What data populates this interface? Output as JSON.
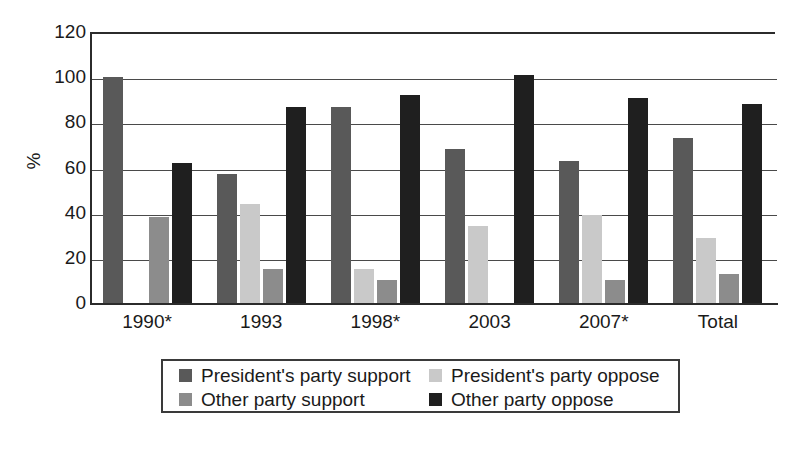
{
  "chart_data": {
    "type": "bar",
    "title": "",
    "subtitle": "",
    "xlabel": "",
    "ylabel": "%",
    "ylim": [
      0,
      120
    ],
    "ytick_step": 20,
    "yticks": [
      120,
      100,
      80,
      60,
      40,
      20,
      0
    ],
    "grid": true,
    "legend_position": "bottom-center",
    "categories": [
      "1990*",
      "1993",
      "1998*",
      "2003",
      "2007*",
      "Total"
    ],
    "series": [
      {
        "name": "President's party support",
        "color": "#595959",
        "values": [
          100,
          57,
          87,
          68,
          63,
          73
        ]
      },
      {
        "name": "President's party oppose",
        "color": "#c9c9c9",
        "values": [
          0,
          44,
          15,
          34,
          39,
          29
        ]
      },
      {
        "name": "Other party support",
        "color": "#8c8c8c",
        "values": [
          38,
          15,
          10,
          0,
          10,
          13
        ]
      },
      {
        "name": "Other party oppose",
        "color": "#1f1f1f",
        "values": [
          62,
          87,
          92,
          101,
          91,
          88
        ]
      }
    ]
  },
  "axis": {
    "y_title": "%",
    "y_tick_labels": [
      "120",
      "100",
      "80",
      "60",
      "40",
      "20",
      "0"
    ],
    "x_tick_labels": [
      "1990*",
      "1993",
      "1998*",
      "2003",
      "2007*",
      "Total"
    ]
  },
  "legend": {
    "entries": [
      {
        "label": "President's party support",
        "color": "#595959"
      },
      {
        "label": "President's party oppose",
        "color": "#c9c9c9"
      },
      {
        "label": "Other party support",
        "color": "#8c8c8c"
      },
      {
        "label": "Other party oppose",
        "color": "#1f1f1f"
      }
    ]
  }
}
